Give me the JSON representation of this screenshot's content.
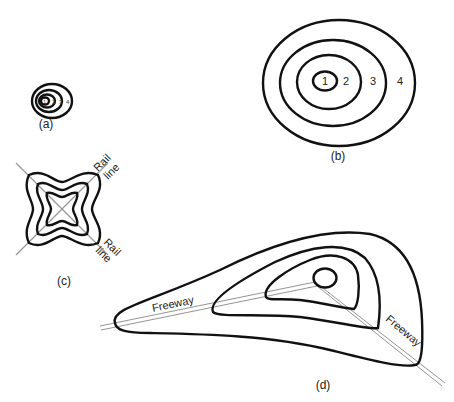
{
  "figure": {
    "panels": [
      {
        "id": "a",
        "caption": "(a)",
        "ring_labels": [
          "1",
          "2",
          "3",
          "4"
        ]
      },
      {
        "id": "b",
        "caption": "(b)",
        "ring_labels": [
          "1",
          "2",
          "3",
          "4"
        ]
      },
      {
        "id": "c",
        "caption": "(c)",
        "line_labels": [
          {
            "line1": "Rail",
            "line2": "line"
          },
          {
            "line1": "Rail",
            "line2": "line"
          }
        ]
      },
      {
        "id": "d",
        "caption": "(d)",
        "road_labels": [
          "Freeway",
          "Freeway"
        ]
      }
    ],
    "colors": {
      "contour": "#111111",
      "rail_line": "#999999",
      "freeway": "#888888",
      "background": "#ffffff"
    }
  }
}
